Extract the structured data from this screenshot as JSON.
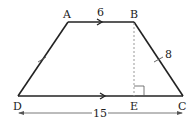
{
  "diagram": {
    "type": "trapezoid",
    "vertices": {
      "A": {
        "label": "A",
        "x": 68,
        "y": 22
      },
      "B": {
        "label": "B",
        "x": 134,
        "y": 22
      },
      "C": {
        "label": "C",
        "x": 183,
        "y": 96
      },
      "D": {
        "label": "D",
        "x": 18,
        "y": 96
      },
      "E": {
        "label": "E",
        "x": 134,
        "y": 96
      }
    },
    "measurements": {
      "AB": "6",
      "BC": "8",
      "DC": "15"
    },
    "annotations": {
      "parallel_marks": [
        "AB",
        "DC"
      ],
      "tick_marks": [
        "AD",
        "BC"
      ],
      "right_angle_at": "E",
      "altitude": "BE (dashed)"
    },
    "colors": {
      "stroke": "#222222",
      "dashed": "#999999",
      "dimension": "#555555"
    }
  }
}
